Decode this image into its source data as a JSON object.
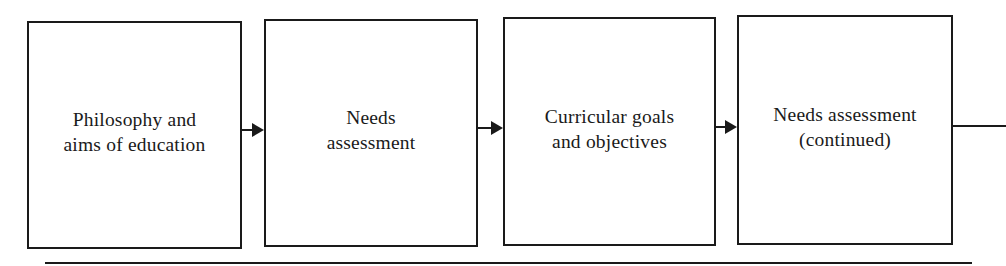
{
  "diagram": {
    "type": "flowchart",
    "direction": "left-to-right",
    "boxes": [
      {
        "id": "b1",
        "label": "Philosophy and\naims of education"
      },
      {
        "id": "b2",
        "label": "Needs\nassessment"
      },
      {
        "id": "b3",
        "label": "Curricular goals\nand objectives"
      },
      {
        "id": "b4",
        "label": "Needs assessment\n(continued)"
      }
    ],
    "edges": [
      {
        "from": "b1",
        "to": "b2",
        "arrow": true
      },
      {
        "from": "b2",
        "to": "b3",
        "arrow": true
      },
      {
        "from": "b3",
        "to": "b4",
        "arrow": true
      },
      {
        "from": "b4",
        "to": "offscreen-right",
        "arrow": false
      }
    ],
    "colors": {
      "stroke": "#1a1a1a",
      "background": "#ffffff"
    }
  }
}
